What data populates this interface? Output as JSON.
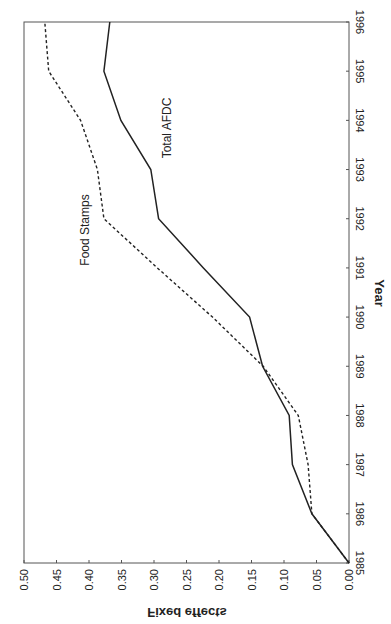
{
  "chart_data": {
    "type": "line",
    "orientation": "rotated-90",
    "title": "",
    "xlabel": "Year",
    "ylabel": "Fixed effects",
    "x": [
      1985,
      1986,
      1987,
      1988,
      1989,
      1990,
      1991,
      1992,
      1993,
      1994,
      1995,
      1996
    ],
    "xlim": [
      1985,
      1996
    ],
    "ylim": [
      0.0,
      0.5
    ],
    "yticks": [
      "0.00",
      "0.05",
      "0.10",
      "0.15",
      "0.20",
      "0.25",
      "0.30",
      "0.35",
      "0.40",
      "0.45",
      "0.50"
    ],
    "xticks": [
      "1985",
      "1986",
      "1987",
      "1988",
      "1989",
      "1990",
      "1991",
      "1992",
      "1993",
      "1994",
      "1995",
      "1996"
    ],
    "grid": false,
    "legend": "inline labels",
    "series": [
      {
        "name": "Total AFDC",
        "style": "solid",
        "values": [
          0.0,
          0.057,
          0.087,
          0.092,
          0.133,
          0.153,
          0.224,
          0.293,
          0.305,
          0.351,
          0.377,
          0.368
        ]
      },
      {
        "name": "Food Stamps",
        "style": "dashed",
        "values": [
          0.0,
          0.057,
          0.063,
          0.078,
          0.132,
          0.21,
          0.295,
          0.377,
          0.387,
          0.413,
          0.462,
          0.468
        ]
      }
    ]
  },
  "labels": {
    "xlabel": "Year",
    "ylabel": "Fixed effects",
    "series_afdc": "Total AFDC",
    "series_fs": "Food Stamps"
  },
  "colors": {
    "line": "#222222",
    "axis": "#555555",
    "background": "#ffffff"
  }
}
